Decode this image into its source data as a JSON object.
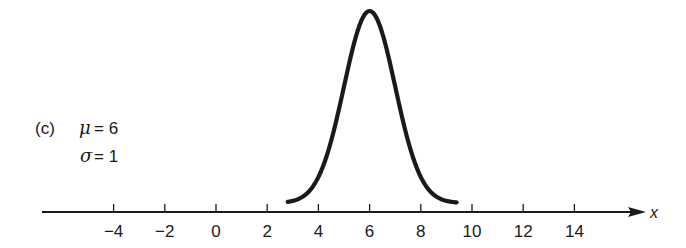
{
  "chart_data": {
    "type": "line",
    "title": "",
    "panel_label": "(c)",
    "annotations": [
      {
        "symbol": "μ",
        "text": "μ = 6",
        "value": 6
      },
      {
        "symbol": "σ",
        "text": "σ = 1",
        "value": 1
      }
    ],
    "xlabel": "x",
    "ylabel": "",
    "x_ticks": [
      -4,
      -2,
      0,
      2,
      4,
      6,
      8,
      10,
      12,
      14
    ],
    "x_tick_labels": [
      "−4",
      "−2",
      "0",
      "2",
      "4",
      "6",
      "8",
      "10",
      "12",
      "14"
    ],
    "xlim": [
      -7,
      17.5
    ],
    "grid": false,
    "legend": null,
    "series": [
      {
        "name": "Normal density (μ=6, σ=1)",
        "distribution": "normal",
        "mean": 6,
        "sd": 1,
        "x_range": [
          2.8,
          9.4
        ],
        "x": [
          2.8,
          3.5,
          4,
          4.5,
          5,
          5.5,
          6,
          6.5,
          7,
          7.5,
          8,
          8.5,
          9,
          9.4
        ],
        "relative_height": [
          0.006,
          0.044,
          0.135,
          0.325,
          0.607,
          0.882,
          1.0,
          0.882,
          0.607,
          0.325,
          0.135,
          0.044,
          0.011,
          0.003
        ]
      }
    ]
  },
  "labels": {
    "panel": "(c)",
    "mu_symbol": "μ",
    "mu_eq": "= 6",
    "sigma_symbol": "σ",
    "sigma_eq": "= 1",
    "axis_var": "x",
    "ticks": [
      "−4",
      "−2",
      "0",
      "2",
      "4",
      "6",
      "8",
      "10",
      "12",
      "14"
    ]
  },
  "colors": {
    "ink": "#1a1a1a",
    "background": "#ffffff"
  }
}
